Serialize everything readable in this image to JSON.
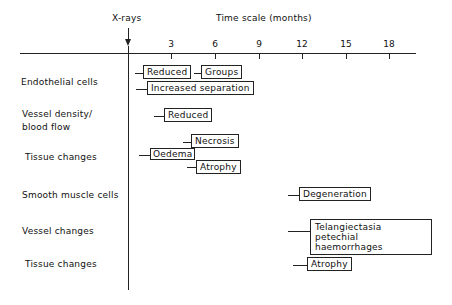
{
  "header": {
    "xray_label": "X-rays",
    "scale_title": "Time scale (months)"
  },
  "axis": {
    "ticks": [
      "3",
      "6",
      "9",
      "12",
      "15",
      "18"
    ]
  },
  "rows": [
    {
      "label": "Endothelial cells"
    },
    {
      "label": "Vessel density/"
    },
    {
      "label": "blood flow"
    },
    {
      "label": "Tissue changes"
    },
    {
      "label": "Smooth muscle cells"
    },
    {
      "label": "Vessel changes"
    },
    {
      "label": "Tissue changes"
    }
  ],
  "events": [
    {
      "text": "Reduced",
      "start_month": 1,
      "end_month": 4
    },
    {
      "text": "Groups",
      "start_month": 5,
      "end_month": 8
    },
    {
      "text": "Increased separation",
      "start_month": 1,
      "end_month": 9
    },
    {
      "text": "Reduced",
      "start_month": 2,
      "end_month": 5
    },
    {
      "text": "Necrosis",
      "start_month": 4,
      "end_month": 8
    },
    {
      "text": "Oedema",
      "start_month": 1,
      "end_month": 4
    },
    {
      "text": "Atrophy",
      "start_month": 4,
      "end_month": 8
    },
    {
      "text": "Degeneration",
      "start_month": 11,
      "end_month": 16
    },
    {
      "text": "Telangiectasia",
      "text2": "petechial haemorrhages",
      "start_month": 11,
      "end_month": 20
    },
    {
      "text": "Atrophy",
      "start_month": 11,
      "end_month": 15
    }
  ]
}
